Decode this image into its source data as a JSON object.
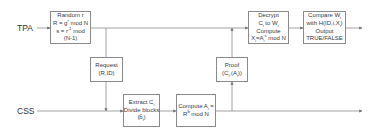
{
  "lanes": {
    "tpa": {
      "label": "TPA"
    },
    "css": {
      "label": "CSS"
    }
  },
  "boxes": {
    "random": {
      "lines": [
        "Random r",
        "R = g^r mod N",
        "s = r^-1 mod",
        "(N-1)"
      ],
      "l1": "Random r",
      "l2a": "R = g",
      "l2sup": "r",
      "l2b": " mod N",
      "l3a": "s = r",
      "l3sup": "-1",
      "l3b": " mod",
      "l4": "(N-1)"
    },
    "request": {
      "lines": [
        "Request",
        "(R,ID)"
      ],
      "l1": "Request",
      "l2": "(R,ID)"
    },
    "extract": {
      "lines": [
        "Extract C_i",
        "Divide blocks",
        "(b̃_i)"
      ],
      "l1a": "Extract C",
      "l1sub": "i",
      "l2": "Divide blocks",
      "l3a": "(b̃",
      "l3sub": "i",
      "l3b": ")"
    },
    "compute_a": {
      "lines": [
        "Compute A_i =",
        "R^b̃ mod N"
      ],
      "l1a": "Compute A",
      "l1sub": "i",
      "l1b": " =",
      "l2a": "R",
      "l2sup": "b̃",
      "l2b": " mod N"
    },
    "proof": {
      "lines": [
        "Proof",
        "(C_i,(A_i))"
      ],
      "l1": "Proof",
      "l2a": "(C",
      "l2sub": "i",
      "l2b": ",(A",
      "l2sub2": "i",
      "l2c": "))"
    },
    "decrypt": {
      "lines": [
        "Decrypt",
        "C_i to W_i",
        "Compute",
        "X_i=A_i^s mod N"
      ],
      "l1": "Decrypt",
      "l2a": "C",
      "l2sub": "i",
      "l2b": " to W",
      "l2sub2": "i",
      "l3": "Compute",
      "l4a": "X",
      "l4sub": "i",
      "l4b": "=A",
      "l4sub2": "i",
      "l4sup": "s",
      "l4c": " mod N"
    },
    "compare": {
      "lines": [
        "Compare W_i",
        "with H(ID,i,X_i)",
        "Output",
        "TRUE/FALSE"
      ],
      "l1a": "Compare W",
      "l1sub": "i",
      "l2a": "with H(ID,i,X",
      "l2sub": "i",
      "l2b": ")",
      "l3": "Output",
      "l4": "TRUE/FALSE"
    }
  },
  "colors": {
    "line": "#8a8a8a",
    "border": "#8a8a8a",
    "text": "#3a3a3a",
    "background": "#ffffff"
  }
}
